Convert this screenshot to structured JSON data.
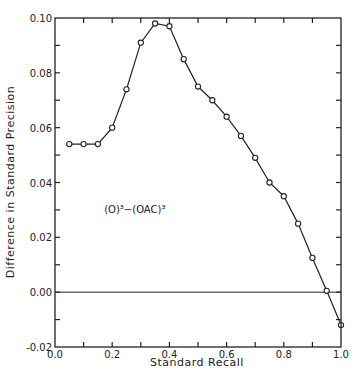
{
  "chart_data": {
    "type": "line",
    "title": "",
    "xlabel": "Standard Recall",
    "ylabel": "Difference in Standard Precision",
    "xlim": [
      0.0,
      1.0
    ],
    "ylim": [
      -0.02,
      0.1
    ],
    "x_ticks": [
      0.0,
      0.1,
      0.2,
      0.3,
      0.4,
      0.5,
      0.6,
      0.7,
      0.8,
      0.9,
      1.0
    ],
    "x_tick_labels": [
      "0.0",
      "0.2",
      "0.4",
      "0.6",
      "0.8",
      "1.0"
    ],
    "x_tick_label_values": [
      0.0,
      0.2,
      0.4,
      0.6,
      0.8,
      1.0
    ],
    "y_ticks": [
      -0.02,
      -0.01,
      0.0,
      0.01,
      0.02,
      0.03,
      0.04,
      0.05,
      0.06,
      0.07,
      0.08,
      0.09,
      0.1
    ],
    "y_tick_labels": [
      "-0.02",
      "0.00",
      "0.02",
      "0.04",
      "0.06",
      "0.08",
      "0.10"
    ],
    "y_tick_label_values": [
      -0.02,
      0.0,
      0.02,
      0.04,
      0.06,
      0.08,
      0.1
    ],
    "grid": false,
    "reference_line": {
      "y": 0.0
    },
    "annotation": {
      "text": "(O)³−(OAC)³",
      "x": 0.2,
      "y": 0.029
    },
    "x": [
      0.05,
      0.1,
      0.15,
      0.2,
      0.25,
      0.3,
      0.35,
      0.4,
      0.45,
      0.5,
      0.55,
      0.6,
      0.65,
      0.7,
      0.75,
      0.8,
      0.85,
      0.9,
      0.95,
      1.0
    ],
    "series": [
      {
        "name": "(O)³−(OAC)³",
        "marker": "open-circle",
        "values": [
          0.054,
          0.054,
          0.054,
          0.06,
          0.074,
          0.091,
          0.098,
          0.097,
          0.085,
          0.075,
          0.07,
          0.064,
          0.057,
          0.049,
          0.04,
          0.035,
          0.025,
          0.0125,
          0.0005,
          -0.012
        ]
      }
    ]
  },
  "labels": {
    "xlabel": "Standard Recall",
    "ylabel": "Difference in Standard Precision",
    "annotation": "(O)³−(OAC)³"
  }
}
